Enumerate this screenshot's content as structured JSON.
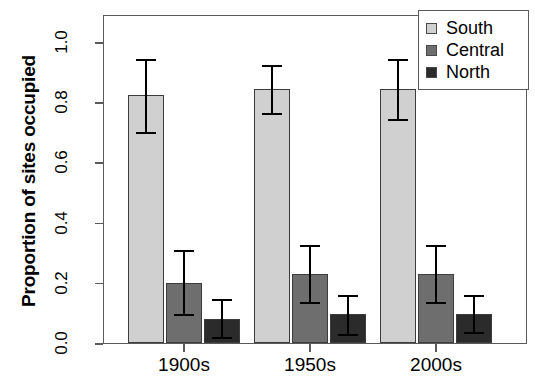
{
  "chart_data": {
    "type": "bar",
    "title": "",
    "subtitle": "",
    "xlabel": "",
    "ylabel": "Proportion of sites occupied",
    "categories": [
      "1900s",
      "1950s",
      "2000s"
    ],
    "ylim": [
      0.0,
      1.08
    ],
    "y_ticks": [
      "0.0",
      "0.2",
      "0.4",
      "0.6",
      "0.8",
      "1.0"
    ],
    "y_tick_values": [
      0.0,
      0.2,
      0.4,
      0.6,
      0.8,
      1.0
    ],
    "grid": false,
    "legend_position": "top-right",
    "error_bar_style": "capped",
    "series": [
      {
        "name": "South",
        "color": "#d0d0d0",
        "values": [
          0.825,
          0.845,
          0.845
        ],
        "err_low": [
          0.7,
          0.765,
          0.745
        ],
        "err_high": [
          0.945,
          0.925,
          0.945
        ]
      },
      {
        "name": "Central",
        "color": "#6e6e6e",
        "values": [
          0.2,
          0.23,
          0.23
        ],
        "err_low": [
          0.095,
          0.135,
          0.135
        ],
        "err_high": [
          0.31,
          0.325,
          0.325
        ]
      },
      {
        "name": "North",
        "color": "#2b2b2b",
        "values": [
          0.08,
          0.095,
          0.095
        ],
        "err_low": [
          0.02,
          0.03,
          0.035
        ],
        "err_high": [
          0.145,
          0.16,
          0.16
        ]
      }
    ]
  },
  "axis": {
    "y_title": "Proportion of sites occupied",
    "y_ticks": [
      "0.0",
      "0.2",
      "0.4",
      "0.6",
      "0.8",
      "1.0"
    ],
    "x_ticks": [
      "1900s",
      "1950s",
      "2000s"
    ]
  },
  "legend": {
    "items": [
      {
        "label": "South",
        "color": "#d0d0d0"
      },
      {
        "label": "Central",
        "color": "#6e6e6e"
      },
      {
        "label": "North",
        "color": "#2b2b2b"
      }
    ]
  },
  "caption": ""
}
